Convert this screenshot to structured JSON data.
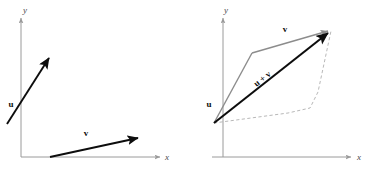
{
  "figure": {
    "background_color": "#ffffff",
    "width": 370,
    "height": 181,
    "colors": {
      "axis": "#9a9a9a",
      "vector_black": "#0d0d0d",
      "vector_gray": "#8c8c8c",
      "dashed_gray": "#b0b0b0",
      "label_axis": "#4a4a4a",
      "label_vector": "#0d0d0d"
    }
  },
  "panels": [
    {
      "id": "left-panel",
      "name": "vectors-u-and-v",
      "axes": {
        "x_label": "x",
        "y_label": "y",
        "origin": {
          "x": 21,
          "y": 157
        },
        "x_axis_end": {
          "x": 162,
          "y": 157
        },
        "y_axis_end": {
          "x": 21,
          "y": 16
        },
        "x_label_pos": {
          "x": 167,
          "y": 160
        },
        "y_label_pos": {
          "x": 25,
          "y": 13
        }
      },
      "vectors": [
        {
          "name": "vector-u",
          "label": "u",
          "color": "#0d0d0d",
          "style": "solid",
          "from": {
            "x": 7,
            "y": 124
          },
          "to": {
            "x": 51,
            "y": 55
          },
          "label_pos": {
            "x": 11,
            "y": 107
          }
        },
        {
          "name": "vector-v",
          "label": "v",
          "color": "#0d0d0d",
          "style": "solid",
          "from": {
            "x": 50,
            "y": 157
          },
          "to": {
            "x": 141,
            "y": 137
          },
          "label_pos": {
            "x": 85,
            "y": 136
          }
        }
      ]
    },
    {
      "id": "right-panel",
      "name": "vector-sum-u-plus-v",
      "axes": {
        "x_label": "x",
        "y_label": "y",
        "origin": {
          "x": 223,
          "y": 157
        },
        "x_axis_end": {
          "x": 353,
          "y": 157
        },
        "y_axis_end": {
          "x": 223,
          "y": 16
        },
        "x_axis_start": {
          "x": 212,
          "y": 157
        },
        "x_label_pos": {
          "x": 358,
          "y": 160
        },
        "y_label_pos": {
          "x": 226,
          "y": 13
        }
      },
      "tail": {
        "x": 214,
        "y": 123
      },
      "head": {
        "x": 331,
        "y": 30
      },
      "vectors": [
        {
          "name": "vector-u",
          "label": "u",
          "color": "#8c8c8c",
          "style": "solid",
          "from": {
            "x": 214,
            "y": 123
          },
          "to": {
            "x": 252,
            "y": 53
          },
          "label_pos": {
            "x": 209,
            "y": 106
          },
          "label_color": "#0d0d0d"
        },
        {
          "name": "vector-v",
          "label": "v",
          "color": "#8c8c8c",
          "style": "solid",
          "from": {
            "x": 252,
            "y": 53
          },
          "to": {
            "x": 331,
            "y": 30
          },
          "label_pos": {
            "x": 283,
            "y": 32
          },
          "label_color": "#0d0d0d"
        },
        {
          "name": "vector-u-plus-v",
          "label": "u + v",
          "color": "#0d0d0d",
          "style": "solid",
          "from": {
            "x": 214,
            "y": 123
          },
          "to": {
            "x": 331,
            "y": 30
          },
          "label_pos": {
            "x": 264,
            "y": 80
          },
          "label_rotation": -38
        }
      ],
      "dashed_path": {
        "name": "parallelogram-dashed-side",
        "color": "#b0b0b0",
        "points": [
          {
            "x": 214,
            "y": 123
          },
          {
            "x": 288,
            "y": 113
          },
          {
            "x": 310,
            "y": 108
          },
          {
            "x": 318,
            "y": 92
          },
          {
            "x": 331,
            "y": 30
          }
        ]
      }
    }
  ]
}
